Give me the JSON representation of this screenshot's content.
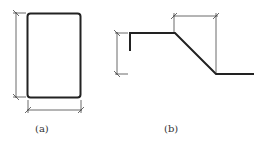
{
  "figures": [
    {
      "id": "a",
      "label": "(a)",
      "shape": "rounded rectangle with vertical (height) and horizontal (width) dimension lines"
    },
    {
      "id": "b",
      "label": "(b)",
      "shape": "bent bar profile: short vertical stub, top horizontal, sloped segment, bottom horizontal; with vertical height and horizontal slope-run dimension lines"
    }
  ],
  "colors": {
    "stroke": "#222222",
    "dim_stroke": "#444444",
    "background": "#ffffff"
  }
}
